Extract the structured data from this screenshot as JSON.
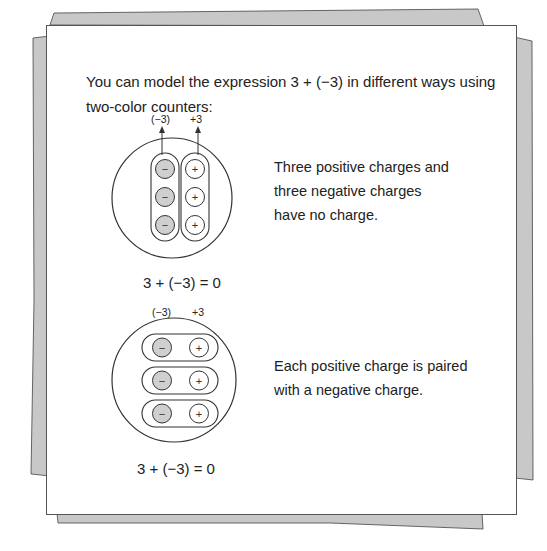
{
  "intro": {
    "text": "You can model the expression 3 + (−3) in different ways using two-color counters:"
  },
  "model1": {
    "label_neg": "(−3)",
    "label_pos": "+3",
    "description": [
      "Three positive charges and",
      "three negative charges",
      "have no charge."
    ],
    "equation": "3 + (−3) = 0",
    "counters": {
      "negative": 3,
      "positive": 3,
      "grouping": "columns"
    }
  },
  "model2": {
    "label_neg": "(−3)",
    "label_pos": "+3",
    "description": [
      "Each positive charge is paired",
      "with a negative charge."
    ],
    "equation": "3 + (−3) = 0",
    "counters": {
      "negative": 3,
      "positive": 3,
      "grouping": "pairs"
    }
  },
  "colors": {
    "negative_counter": "#cfcfcf",
    "positive_counter": "#ffffff",
    "page_shadow": "#c8c8c8",
    "stroke": "#333333"
  },
  "symbols": {
    "minus": "−",
    "plus": "+"
  }
}
